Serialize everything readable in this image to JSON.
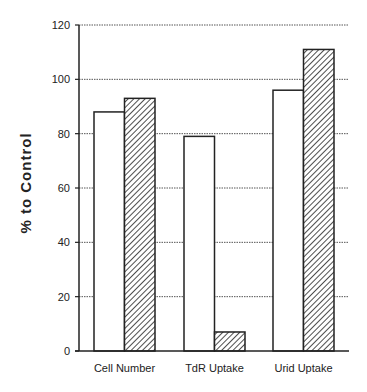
{
  "chart_data": {
    "type": "bar",
    "title": "",
    "xlabel": "",
    "ylabel": "% to Control",
    "ylim": [
      0,
      120
    ],
    "yticks": [
      0,
      20,
      40,
      60,
      80,
      100,
      120
    ],
    "grid": true,
    "legend": "none",
    "categories": [
      "Cell Number",
      "TdR Uptake",
      "Urid Uptake"
    ],
    "series": [
      {
        "name": "open",
        "fill": "white",
        "values": [
          88,
          79,
          96
        ]
      },
      {
        "name": "hatched",
        "fill": "diagonal-hatch",
        "values": [
          93,
          7,
          111
        ]
      }
    ]
  },
  "axis": {
    "y_title": "% to Control",
    "ticks": [
      "0",
      "20",
      "40",
      "60",
      "80",
      "100",
      "120"
    ]
  },
  "categories": [
    "Cell Number",
    "TdR Uptake",
    "Urid Uptake"
  ],
  "colors": {
    "stroke": "#222222",
    "grid": "#555555",
    "background": "#ffffff"
  }
}
